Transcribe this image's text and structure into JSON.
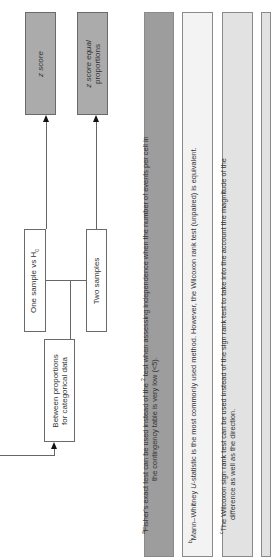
{
  "nodes": {
    "z_score": "z score",
    "z_score_equal_proportions_line1": "z score equal",
    "z_score_equal_proportions_line2": "proportions",
    "one_sample": "One sample vs H",
    "one_sample_sub": "0",
    "two_samples": "Two samples",
    "between_proportions_line1": "Between proportions",
    "between_proportions_line2": "for categorical data"
  },
  "footnotes": [
    {
      "marker": "a",
      "line1_pre": "Fisher's exact test can be used instead of the ",
      "line1_sup": "2",
      "line1_post": " test when assessing independence when the number of events per cell in",
      "line2": "the contingency table is very low (<5).",
      "fill": "#9d9d9d"
    },
    {
      "marker": "b",
      "pre": "Mann–Whitney ",
      "italic": "U",
      "post": "-statistic is the most commonly used method. However, the Wilcoxon rank test (unpaired) is equivalent.",
      "fill": "#f3f3f3"
    },
    {
      "marker": "c",
      "line1": "The Wilcoxon sign rank test can be used instead of the sign rank test to take into the account the magnitude of the",
      "line2": "difference as well as the direction.",
      "fill": "#e2e2e2"
    }
  ],
  "colors": {
    "result_box": "#ababab",
    "category_box": "#ffffff",
    "border": "#6a6a6a",
    "connector": "#666666",
    "arrowhead": "#111111"
  }
}
